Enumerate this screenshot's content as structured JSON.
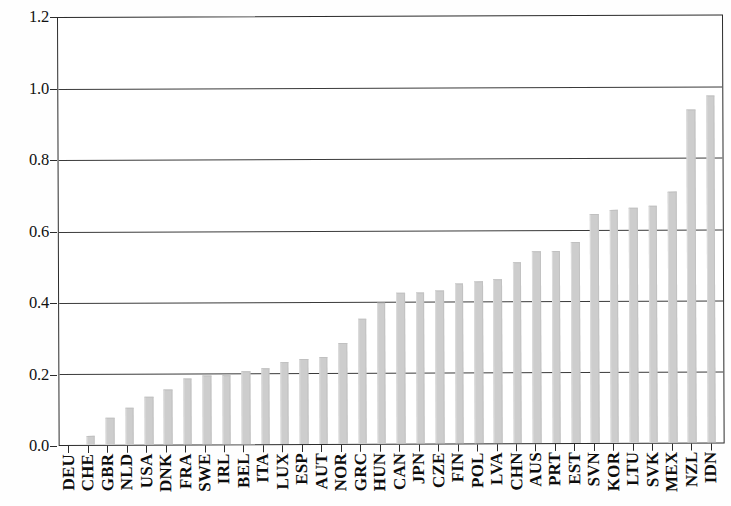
{
  "chart_data": {
    "type": "bar",
    "title": "",
    "subtitle": "",
    "xlabel": "",
    "ylabel": "",
    "ylim": [
      0.0,
      1.2
    ],
    "grid": true,
    "legend": null,
    "orientation": "vertical",
    "bar_color": "#cdcdcd",
    "axis_color": "#2b2b2b",
    "y_ticks": [
      "0.0",
      "0.2",
      "0.4",
      "0.6",
      "0.8",
      "1.0",
      "1.2"
    ],
    "y_tick_values": [
      0.0,
      0.2,
      0.4,
      0.6,
      0.8,
      1.0,
      1.2
    ],
    "categories": [
      "DEU",
      "CHE",
      "GBR",
      "NLD",
      "USA",
      "DNK",
      "FRA",
      "SWE",
      "IRL",
      "BEL",
      "ITA",
      "LUX",
      "ESP",
      "AUT",
      "NOR",
      "GRC",
      "HUN",
      "CAN",
      "JPN",
      "CZE",
      "FIN",
      "POL",
      "LVA",
      "CHN",
      "AUS",
      "PRT",
      "EST",
      "SVN",
      "KOR",
      "LTU",
      "SVK",
      "MEX",
      "NZL",
      "IDN"
    ],
    "values": [
      0.0,
      0.025,
      0.075,
      0.105,
      0.135,
      0.155,
      0.185,
      0.195,
      0.195,
      0.205,
      0.215,
      0.23,
      0.24,
      0.245,
      0.285,
      0.35,
      0.395,
      0.425,
      0.425,
      0.43,
      0.45,
      0.455,
      0.46,
      0.51,
      0.54,
      0.54,
      0.565,
      0.645,
      0.655,
      0.66,
      0.665,
      0.705,
      0.935,
      0.975
    ]
  }
}
